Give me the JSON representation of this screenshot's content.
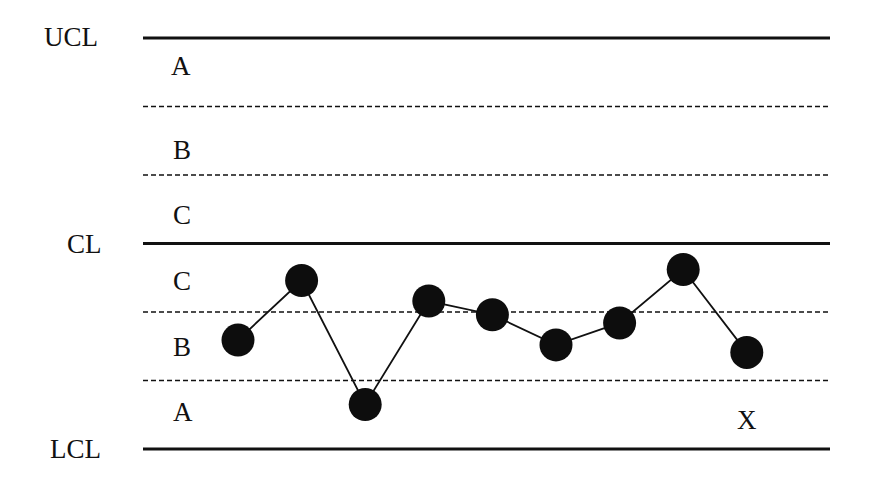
{
  "chart_data": {
    "type": "line",
    "title": "",
    "xlabel": "",
    "ylabel": "",
    "grid": false,
    "control_lines": [
      {
        "name": "UCL",
        "label": "UCL",
        "y": 3,
        "style": "solid"
      },
      {
        "name": "upper-2sigma",
        "label": "",
        "y": 2,
        "style": "dashed"
      },
      {
        "name": "upper-1sigma",
        "label": "",
        "y": 1,
        "style": "dashed"
      },
      {
        "name": "CL",
        "label": "CL",
        "y": 0,
        "style": "solid"
      },
      {
        "name": "lower-1sigma",
        "label": "",
        "y": -1,
        "style": "dashed"
      },
      {
        "name": "lower-2sigma",
        "label": "",
        "y": -2,
        "style": "dashed"
      },
      {
        "name": "LCL",
        "label": "LCL",
        "y": -3,
        "style": "solid"
      }
    ],
    "zones_upper": [
      "A",
      "B",
      "C"
    ],
    "zones_lower": [
      "C",
      "B",
      "A"
    ],
    "series": [
      {
        "name": "X",
        "x": [
          1,
          2,
          3,
          4,
          5,
          6,
          7,
          8,
          9
        ],
        "values": [
          -1.41,
          -0.54,
          -2.35,
          -0.84,
          -1.04,
          -1.48,
          -1.16,
          -0.38,
          -1.59
        ]
      }
    ],
    "annotations": [
      {
        "text": "X",
        "x": 9,
        "y": -2.55
      }
    ],
    "ylim": [
      -3,
      3
    ]
  },
  "labels": {
    "ucl": "UCL",
    "cl": "CL",
    "lcl": "LCL",
    "zone_a_upper": "A",
    "zone_b_upper": "B",
    "zone_c_upper": "C",
    "zone_c_lower": "C",
    "zone_b_lower": "B",
    "zone_a_lower": "A",
    "series_marker": "X"
  }
}
